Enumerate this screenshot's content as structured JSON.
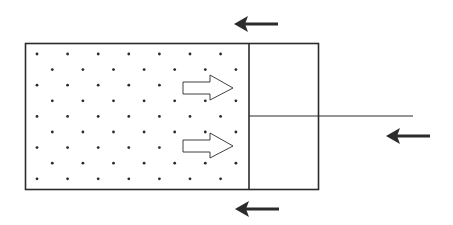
{
  "diagram": {
    "colors": {
      "line": "#2b2b2b",
      "particle": "#2b2b2b",
      "background": "#ffffff",
      "hollow_arrow_fill": "#ffffff"
    },
    "container": {
      "label": "gas-filled cylinder",
      "particle_rows": 9,
      "particles_per_row": 7
    },
    "piston": {
      "label": "piston with rod"
    },
    "force_arrows": [
      {
        "id": "top",
        "direction": "left",
        "style": "solid"
      },
      {
        "id": "rod",
        "direction": "left",
        "style": "solid"
      },
      {
        "id": "bottom",
        "direction": "left",
        "style": "solid"
      }
    ],
    "pressure_arrows": [
      {
        "id": "upper",
        "direction": "right",
        "style": "hollow"
      },
      {
        "id": "lower",
        "direction": "right",
        "style": "hollow"
      }
    ]
  }
}
